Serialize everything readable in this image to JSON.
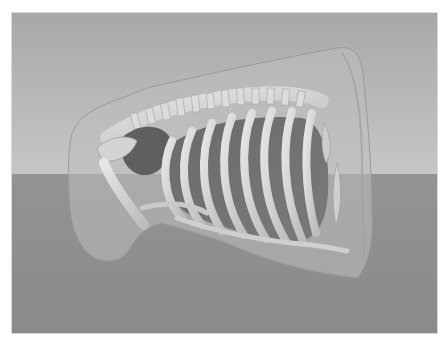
{
  "scene": {
    "description": "3D volume render of a rodent torso: translucent body surface enclosing skeleton (spine, rib cage, shoulder girdle, forelimb) and dark inner organs (lungs, heart)",
    "colors": {
      "page_background": "#ffffff",
      "sky_top": "#a9a9a9",
      "sky_bottom": "#c4c4c4",
      "ground": "#8e8e8e",
      "body_shell": "#b8b8b8",
      "bone": "#d9d9d9",
      "organ": "#6f6f6f"
    },
    "viewport": {
      "x": 12,
      "y": 13,
      "width": 425,
      "height": 320,
      "horizon_y": 161
    }
  }
}
